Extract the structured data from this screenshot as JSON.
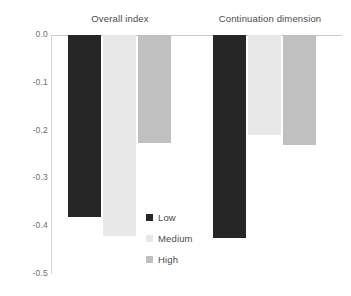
{
  "chart_data": {
    "type": "bar",
    "title": "",
    "subtitle": "",
    "xlabel": "",
    "ylabel": "",
    "categories": [
      "Overall index",
      "Continuation dimension"
    ],
    "series": [
      {
        "name": "Low",
        "color": "#262626",
        "values": [
          -0.38,
          -0.425
        ]
      },
      {
        "name": "Medium",
        "color": "#e8e8e8",
        "values": [
          -0.42,
          -0.21
        ]
      },
      {
        "name": "High",
        "color": "#c0c0c0",
        "values": [
          -0.225,
          -0.23
        ]
      }
    ],
    "ylim": [
      -0.5,
      0.0
    ],
    "y_ticks": [
      "0.0",
      "-0.1",
      "-0.2",
      "-0.3",
      "-0.4",
      "-0.5"
    ],
    "y_tick_values": [
      0.0,
      -0.1,
      -0.2,
      -0.3,
      -0.4,
      -0.5
    ],
    "grid": false,
    "legend_position": "inside-center",
    "legend_entries": [
      "Low",
      "Medium",
      "High"
    ],
    "annotations": []
  },
  "axis": {
    "ticks": [
      {
        "label": "0.0",
        "value": 0.0
      },
      {
        "label": "-0.1",
        "value": -0.1
      },
      {
        "label": "-0.2",
        "value": -0.2
      },
      {
        "label": "-0.3",
        "value": -0.3
      },
      {
        "label": "-0.4",
        "value": -0.4
      },
      {
        "label": "-0.5",
        "value": -0.5
      }
    ]
  },
  "groups": [
    {
      "label": "Overall index"
    },
    {
      "label": "Continuation dimension"
    }
  ],
  "legend": {
    "items": [
      {
        "label": "Low",
        "color": "#262626"
      },
      {
        "label": "Medium",
        "color": "#e8e8e8"
      },
      {
        "label": "High",
        "color": "#c0c0c0"
      }
    ]
  }
}
